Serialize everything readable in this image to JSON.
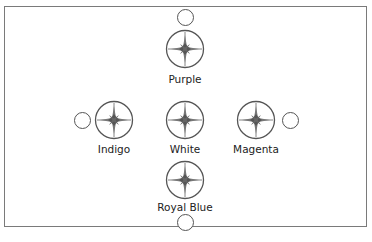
{
  "diagram": {
    "type": "cross-layout compass color nodes",
    "nodes": [
      {
        "id": "purple",
        "label": "Purple",
        "position": "top"
      },
      {
        "id": "indigo",
        "label": "Indigo",
        "position": "left"
      },
      {
        "id": "white",
        "label": "White",
        "position": "center"
      },
      {
        "id": "magenta",
        "label": "Magenta",
        "position": "right"
      },
      {
        "id": "royal-blue",
        "label": "Royal Blue",
        "position": "bottom"
      }
    ],
    "connectors": [
      "top",
      "left",
      "right",
      "bottom"
    ],
    "colors": {
      "stroke": "#555555",
      "star": "#666666",
      "border": "#7a7a7a"
    }
  }
}
